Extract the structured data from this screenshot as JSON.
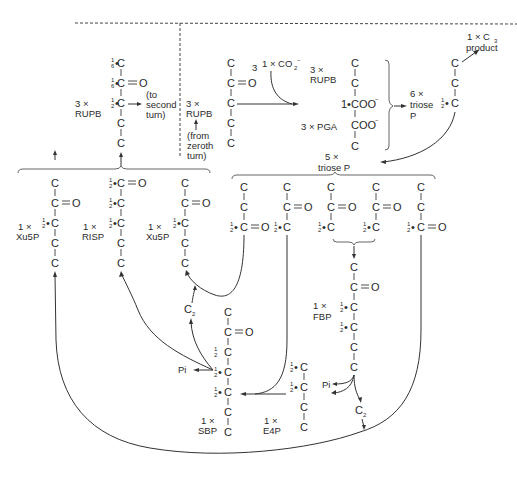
{
  "diagram": {
    "labels": {
      "rupb_left_count": "3 ×",
      "rupb_left_name": "RUPB",
      "to_second_turn": [
        "(to",
        "second",
        "turn)"
      ],
      "rupb_mid_count": "3 ×",
      "rupb_mid_name": "RUPB",
      "from_zeroth_turn": [
        "(from",
        "zeroth",
        "turn)"
      ],
      "co2_prefix_3": "3",
      "co2_label": "1 × CO",
      "co2_sub": "2",
      "co2_sup": "−",
      "rupb_right_count": "3 ×",
      "rupb_right_name": "RUPB",
      "pga_label": "3 × PGA",
      "coo_1": "1•COO",
      "coo_1_sup": "−",
      "coo_2": "COO",
      "coo_2_sup": "−",
      "triose6_count": "6 ×",
      "triose6_name": "triose",
      "triose6_p": "P",
      "product_count": "1 × C",
      "product_sub": "3",
      "product_name": "product",
      "triose5_count": "5 ×",
      "triose5_name": "triose P",
      "xu5p_1_count": "1 ×",
      "xu5p_1_name": "Xu5P",
      "r5p_count": "1 ×",
      "r5p_name": "RISP",
      "xu5p_2_count": "1 ×",
      "xu5p_2_name": "Xu5P",
      "fbp_count": "1 ×",
      "fbp_name": "FBP",
      "sbp_count": "1 ×",
      "sbp_name": "SBP",
      "e4p_count": "1 ×",
      "e4p_name": "E4P",
      "pi_left": "Pi",
      "pi_right": "Pi",
      "c2_left": "C",
      "c2_left_sub": "2",
      "c2_right": "C",
      "c2_right_sub": "2"
    },
    "atoms": {
      "C": "C",
      "O": "O",
      "half": "1",
      "half_den": "2",
      "sixth": "1",
      "sixth_den": "6"
    }
  }
}
